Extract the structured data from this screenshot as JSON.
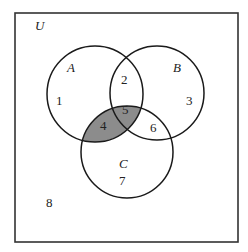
{
  "diagram": {
    "type": "venn",
    "universe_label": "U",
    "sets": [
      {
        "name": "A",
        "label": "A"
      },
      {
        "name": "B",
        "label": "B"
      },
      {
        "name": "C",
        "label": "C"
      }
    ],
    "regions": [
      {
        "id": "1",
        "label": "1",
        "membership": "A only",
        "shaded": false
      },
      {
        "id": "2",
        "label": "2",
        "membership": "A and B only",
        "shaded": false
      },
      {
        "id": "3",
        "label": "3",
        "membership": "B only",
        "shaded": false
      },
      {
        "id": "4",
        "label": "4",
        "membership": "A and C only",
        "shaded": true
      },
      {
        "id": "5",
        "label": "5",
        "membership": "A, B and C",
        "shaded": true
      },
      {
        "id": "6",
        "label": "6",
        "membership": "B and C only",
        "shaded": false
      },
      {
        "id": "7",
        "label": "7",
        "membership": "C only",
        "shaded": false
      },
      {
        "id": "8",
        "label": "8",
        "membership": "outside A, B, C",
        "shaded": false
      }
    ],
    "shaded_set": "A ∩ C",
    "colors": {
      "shade": "#8c8c8c",
      "stroke": "#1a1a1a",
      "frame": "#333333",
      "background": "#ffffff"
    }
  }
}
